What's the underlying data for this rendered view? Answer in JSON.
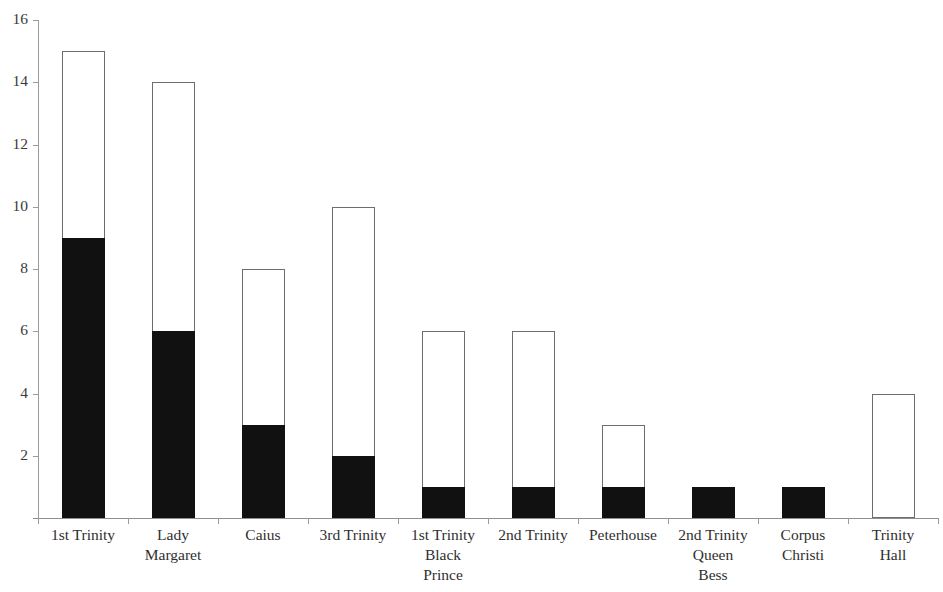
{
  "chart_data": {
    "type": "bar",
    "subtype": "stacked-bar",
    "title": "",
    "subtitle": "",
    "xlabel": "",
    "ylabel": "",
    "ylim": [
      0,
      16
    ],
    "ytick_labels": [
      "16",
      "14",
      "12",
      "10",
      "8",
      "6",
      "4",
      "2"
    ],
    "ytick_values": [
      16,
      14,
      12,
      10,
      8,
      6,
      4,
      2
    ],
    "ytick_step": 2,
    "grid": false,
    "legend": false,
    "legend_position": "none",
    "background_color": "#ffffff",
    "axis_color": "#9a9a9a",
    "categories": [
      "1st Trinity",
      "Lady Margaret",
      "Caius",
      "3rd Trinity",
      "1st Trinity Black Prince",
      "2nd Trinity",
      "Peterhouse",
      "2nd Trinity Queen Bess",
      "Corpus Christi",
      "Trinity Hall"
    ],
    "category_label_lines": [
      [
        "1st Trinity"
      ],
      [
        "Lady",
        "Margaret"
      ],
      [
        "Caius"
      ],
      [
        "3rd Trinity"
      ],
      [
        "1st Trinity",
        "Black",
        "Prince"
      ],
      [
        "2nd Trinity"
      ],
      [
        "Peterhouse"
      ],
      [
        "2nd Trinity",
        "Queen",
        "Bess"
      ],
      [
        "Corpus",
        "Christi"
      ],
      [
        "Trinity",
        "Hall"
      ]
    ],
    "series": [
      {
        "name": "black",
        "color": "#111111",
        "values": [
          9,
          6,
          3,
          2,
          1,
          1,
          1,
          1,
          1,
          0
        ]
      },
      {
        "name": "white",
        "color": "#ffffff",
        "values": [
          6,
          8,
          5,
          8,
          5,
          5,
          2,
          0,
          0,
          4
        ]
      }
    ],
    "totals": [
      15,
      14,
      8,
      10,
      6,
      6,
      3,
      1,
      1,
      4
    ]
  }
}
